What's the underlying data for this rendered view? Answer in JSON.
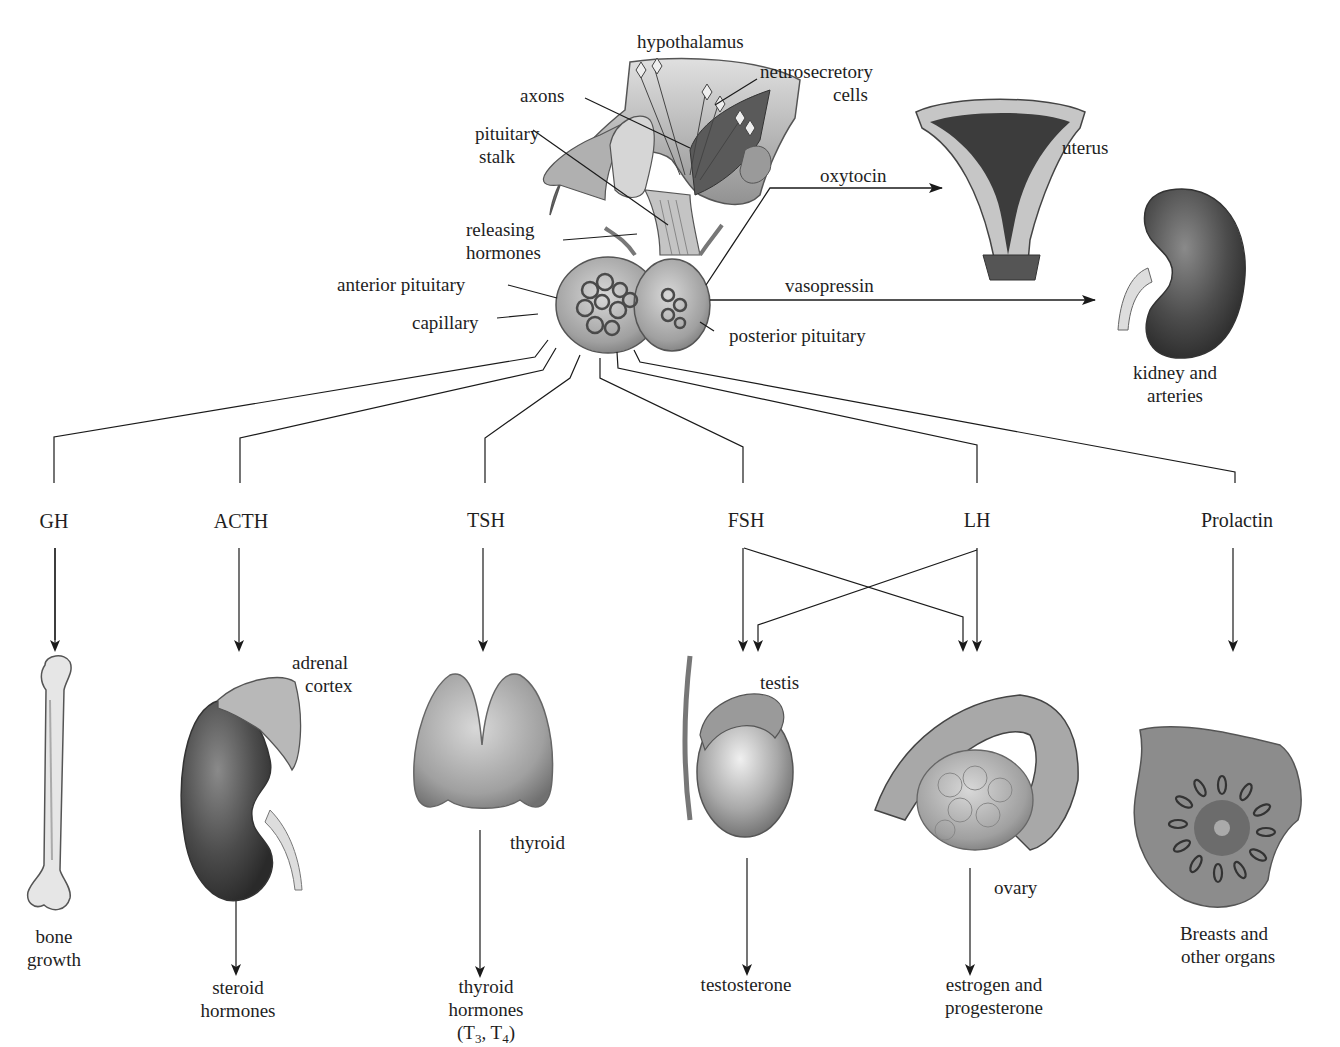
{
  "pituitary": {
    "hypothalamus": "hypothalamus",
    "neurosecretory_1": "neurosecretory",
    "neurosecretory_2": "cells",
    "axons": "axons",
    "stalk_1": "pituitary",
    "stalk_2": "stalk",
    "releasing_1": "releasing",
    "releasing_2": "hormones",
    "anterior": "anterior pituitary",
    "capillary": "capillary",
    "posterior": "posterior pituitary"
  },
  "posterior_hormones": [
    {
      "hormone": "oxytocin",
      "target": "uterus"
    },
    {
      "hormone": "vasopressin",
      "target_1": "kidney and",
      "target_2": "arteries"
    }
  ],
  "anterior_hormones": [
    {
      "hormone": "GH",
      "organ": "",
      "effect_1": "bone",
      "effect_2": "growth"
    },
    {
      "hormone": "ACTH",
      "organ_1": "adrenal",
      "organ_2": "cortex",
      "effect_1": "steroid",
      "effect_2": "hormones"
    },
    {
      "hormone": "TSH",
      "organ": "thyroid",
      "effect_1": "thyroid",
      "effect_2": "hormones",
      "effect_3_prefix": "(T",
      "effect_3_sub1": "3",
      "effect_3_mid": ", T",
      "effect_3_sub2": "4",
      "effect_3_suffix": ")"
    },
    {
      "hormone": "FSH",
      "organ": "testis",
      "effect_1": "testosterone"
    },
    {
      "hormone": "LH",
      "organ": "ovary",
      "effect_1": "estrogen and",
      "effect_2": "progesterone"
    },
    {
      "hormone": "Prolactin",
      "effect_1": "Breasts and",
      "effect_2": "other organs"
    }
  ],
  "colors": {
    "line": "#1a1a1a",
    "tissue_light": "#c9c9c9",
    "tissue_mid": "#9a9a9a",
    "tissue_dark": "#4a4a4a"
  }
}
